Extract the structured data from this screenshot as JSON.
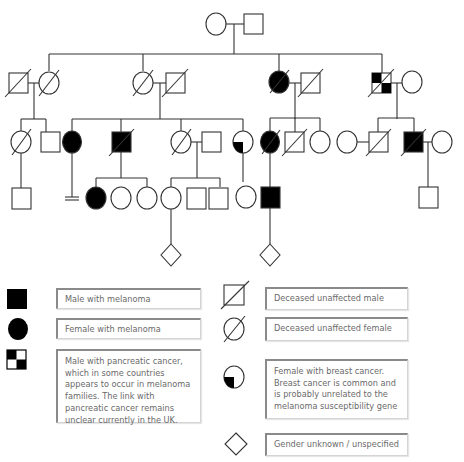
{
  "pedigree": {
    "stroke_color": "#333333",
    "fill_affected": "#000000",
    "generations": [
      {
        "generation": 1,
        "individuals": [
          {
            "id": "g1-f",
            "sex": "female",
            "status": "unaffected"
          },
          {
            "id": "g1-m",
            "sex": "male",
            "status": "unaffected"
          }
        ]
      },
      {
        "generation": 2,
        "individuals": [
          {
            "id": "g2-1",
            "sex": "male",
            "status": "deceased-unaffected",
            "relation": "spouse"
          },
          {
            "id": "g2-2",
            "sex": "female",
            "status": "deceased-unaffected"
          },
          {
            "id": "g2-3",
            "sex": "female",
            "status": "deceased-unaffected"
          },
          {
            "id": "g2-4",
            "sex": "male",
            "status": "deceased-unaffected",
            "relation": "spouse"
          },
          {
            "id": "g2-5",
            "sex": "female",
            "status": "deceased-melanoma"
          },
          {
            "id": "g2-6",
            "sex": "male",
            "status": "deceased-unaffected",
            "relation": "spouse"
          },
          {
            "id": "g2-7",
            "sex": "male",
            "status": "deceased-melanoma-pancreatic"
          },
          {
            "id": "g2-8",
            "sex": "female",
            "status": "unaffected",
            "relation": "spouse"
          }
        ]
      },
      {
        "generation": 3,
        "individuals": [
          {
            "id": "g3-1",
            "sex": "female",
            "status": "deceased-unaffected"
          },
          {
            "id": "g3-2",
            "sex": "male",
            "status": "unaffected"
          },
          {
            "id": "g3-3",
            "sex": "female",
            "status": "melanoma"
          },
          {
            "id": "g3-4",
            "sex": "male",
            "status": "deceased-melanoma"
          },
          {
            "id": "g3-5",
            "sex": "female",
            "status": "deceased-unaffected"
          },
          {
            "id": "g3-6",
            "sex": "male",
            "status": "unaffected",
            "relation": "spouse"
          },
          {
            "id": "g3-7",
            "sex": "female",
            "status": "breast-cancer"
          },
          {
            "id": "g3-8",
            "sex": "female",
            "status": "deceased-melanoma"
          },
          {
            "id": "g3-9",
            "sex": "male",
            "status": "deceased-unaffected"
          },
          {
            "id": "g3-10",
            "sex": "female",
            "status": "unaffected"
          },
          {
            "id": "g3-11",
            "sex": "female",
            "status": "unaffected",
            "relation": "spouse"
          },
          {
            "id": "g3-12",
            "sex": "male",
            "status": "deceased-unaffected"
          },
          {
            "id": "g3-13",
            "sex": "male",
            "status": "deceased-melanoma"
          },
          {
            "id": "g3-14",
            "sex": "female",
            "status": "unaffected",
            "relation": "spouse"
          }
        ]
      },
      {
        "generation": 4,
        "individuals": [
          {
            "id": "g4-1",
            "sex": "male",
            "status": "unaffected"
          },
          {
            "id": "g4-2",
            "sex": "none",
            "status": "no-offspring"
          },
          {
            "id": "g4-3",
            "sex": "female",
            "status": "melanoma"
          },
          {
            "id": "g4-4",
            "sex": "female",
            "status": "unaffected"
          },
          {
            "id": "g4-5",
            "sex": "female",
            "status": "unaffected"
          },
          {
            "id": "g4-6",
            "sex": "female",
            "status": "unaffected"
          },
          {
            "id": "g4-7",
            "sex": "male",
            "status": "unaffected"
          },
          {
            "id": "g4-8",
            "sex": "male",
            "status": "unaffected"
          },
          {
            "id": "g4-9",
            "sex": "female",
            "status": "unaffected"
          },
          {
            "id": "g4-10",
            "sex": "male",
            "status": "melanoma"
          },
          {
            "id": "g4-11",
            "sex": "male",
            "status": "unaffected"
          }
        ]
      },
      {
        "generation": 5,
        "individuals": [
          {
            "id": "g5-1",
            "sex": "unknown",
            "status": "unaffected"
          },
          {
            "id": "g5-2",
            "sex": "unknown",
            "status": "unaffected"
          }
        ]
      }
    ]
  },
  "legend": {
    "items": [
      {
        "symbol": "filled-square",
        "label": "Male with melanoma"
      },
      {
        "symbol": "filled-circle",
        "label": "Female with melanoma"
      },
      {
        "symbol": "checkered-square",
        "label": "Male with pancreatic cancer, which in some countries appears to occur in melanoma families. The link with pancreatic cancer remains unclear currently in the UK."
      },
      {
        "symbol": "deceased-square",
        "label": "Deceased unaffected male"
      },
      {
        "symbol": "deceased-circle",
        "label": "Deceased unaffected female"
      },
      {
        "symbol": "quarter-circle",
        "label": "Female with breast cancer. Breast cancer is common and is probably unrelated to the melanoma susceptibility gene"
      },
      {
        "symbol": "diamond",
        "label": "Gender unknown / unspecified"
      }
    ]
  }
}
